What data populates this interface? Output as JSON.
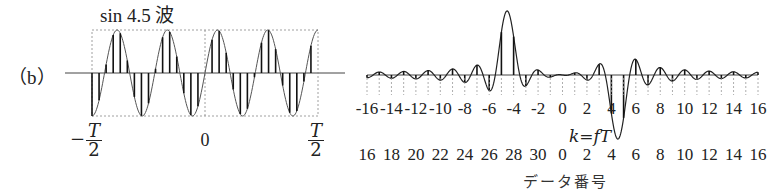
{
  "panel_label": "（b）",
  "left_panel": {
    "title": "sin 4.5 波",
    "x_labels": {
      "left": {
        "sign": "−",
        "num": "T",
        "den": "2"
      },
      "center": "0",
      "right": {
        "num": "T",
        "den": "2"
      }
    }
  },
  "right_panel": {
    "axis1_label": "k=fT",
    "axis2_label": "データ番号",
    "k_ticks": [
      "-16",
      "-14",
      "-12",
      "-10",
      "-8",
      "-6",
      "-4",
      "-2",
      "0",
      "2",
      "4",
      "6",
      "8",
      "10",
      "12",
      "14",
      "16"
    ],
    "data_ticks": [
      "16",
      "18",
      "20",
      "22",
      "24",
      "26",
      "28",
      "30",
      "0",
      "2",
      "4",
      "6",
      "8",
      "10",
      "12",
      "14",
      "16"
    ]
  },
  "chart_data": [
    {
      "type": "line",
      "title": "sin 4.5 波",
      "description": "Sampled sine wave with 4.5 cycles over window T (32 samples), shown with stems",
      "x_range": [
        "-T/2",
        "T/2"
      ],
      "cycles": 4.5,
      "samples": 32,
      "ylim": [
        -1,
        1
      ]
    },
    {
      "type": "line",
      "title": "Spectrum of sin 4.5 wave (sinc leakage)",
      "xlabel": "k=fT",
      "xlabel2": "データ番号",
      "x_range": [
        -16,
        16
      ],
      "peaks": [
        {
          "k": -4.5,
          "value": 1.0
        },
        {
          "k": 4.5,
          "value": -1.0
        }
      ],
      "description": "Imaginary part showing sinc-shaped main lobes at k=±4.5 with leakage sidelobes; sampled stems at integer k"
    }
  ]
}
